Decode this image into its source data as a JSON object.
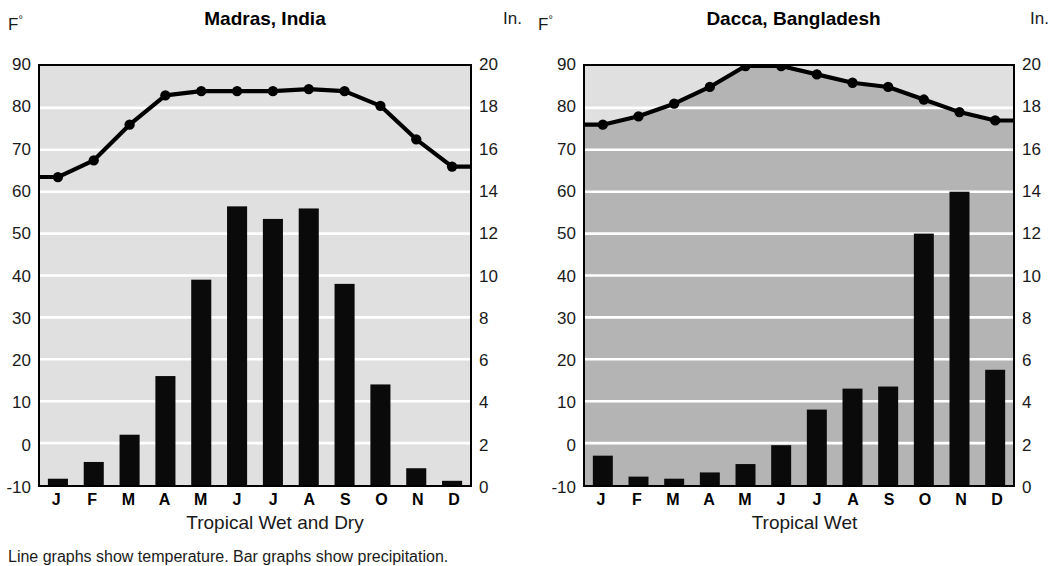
{
  "footnote": "Line graphs show temperature.  Bar graphs show precipitation.",
  "axis_labels": {
    "temperature_unit": "F",
    "degree_symbol": "°",
    "precip_unit": "In."
  },
  "months": [
    "J",
    "F",
    "M",
    "A",
    "M",
    "J",
    "J",
    "A",
    "S",
    "O",
    "N",
    "D"
  ],
  "colors": {
    "plot_background": "#e0e0e0",
    "plot_background_under_line": "#b4b4b4",
    "bar": "#0a0a0a",
    "line": "#000000",
    "gridline": "#ffffff",
    "border": "#000000"
  },
  "charts": [
    {
      "id": "madras",
      "title": "Madras, India",
      "climate_label": "Tropical Wet and Dry",
      "temp_ticks": [
        90,
        80,
        70,
        60,
        50,
        40,
        30,
        20,
        10,
        0,
        -10
      ],
      "precip_ticks": [
        20,
        18,
        16,
        14,
        12,
        10,
        8,
        6,
        4,
        2,
        0
      ],
      "temp_range": [
        -10,
        90
      ],
      "precip_range": [
        0,
        20
      ],
      "shade_under_line": false
    },
    {
      "id": "dacca",
      "title": "Dacca, Bangladesh",
      "climate_label": "Tropical Wet",
      "temp_ticks": [
        90,
        80,
        70,
        60,
        50,
        40,
        30,
        20,
        10,
        0,
        -10
      ],
      "precip_ticks": [
        20,
        18,
        16,
        14,
        12,
        10,
        8,
        6,
        4,
        2,
        0
      ],
      "temp_range": [
        -10,
        90
      ],
      "precip_range": [
        0,
        20
      ],
      "shade_under_line": true
    }
  ],
  "chart_data": [
    {
      "type": "line",
      "id": "madras",
      "title": "Madras, India",
      "subtitle": "Tropical Wet and Dry",
      "xlabel": "",
      "ylabel": "F°",
      "y2label": "In.",
      "categories": [
        "J",
        "F",
        "M",
        "A",
        "M",
        "J",
        "J",
        "A",
        "S",
        "O",
        "N",
        "D"
      ],
      "ylim": [
        -10,
        90
      ],
      "y2lim": [
        0,
        20
      ],
      "yticks": [
        -10,
        0,
        10,
        20,
        30,
        40,
        50,
        60,
        70,
        80,
        90
      ],
      "y2ticks": [
        0,
        2,
        4,
        6,
        8,
        10,
        12,
        14,
        16,
        18,
        20
      ],
      "grid": true,
      "legend": "none",
      "series": [
        {
          "name": "Temperature",
          "unit": "F°",
          "axis": "left",
          "plot": "line",
          "values": [
            63.5,
            67.5,
            76,
            83,
            84,
            84,
            84,
            84.5,
            84,
            80.5,
            72.5,
            66
          ]
        },
        {
          "name": "Precipitation",
          "unit": "In.",
          "axis": "right",
          "plot": "bar",
          "values": [
            0.3,
            1.1,
            2.4,
            5.2,
            9.8,
            13.3,
            12.7,
            13.2,
            9.6,
            4.8,
            0.8,
            0.2
          ]
        }
      ]
    },
    {
      "type": "line",
      "id": "dacca",
      "title": "Dacca, Bangladesh",
      "subtitle": "Tropical Wet",
      "xlabel": "",
      "ylabel": "F°",
      "y2label": "In.",
      "categories": [
        "J",
        "F",
        "M",
        "A",
        "M",
        "J",
        "J",
        "A",
        "S",
        "O",
        "N",
        "D"
      ],
      "ylim": [
        -10,
        90
      ],
      "y2lim": [
        0,
        20
      ],
      "yticks": [
        -10,
        0,
        10,
        20,
        30,
        40,
        50,
        60,
        70,
        80,
        90
      ],
      "y2ticks": [
        0,
        2,
        4,
        6,
        8,
        10,
        12,
        14,
        16,
        18,
        20
      ],
      "grid": true,
      "legend": "none",
      "series": [
        {
          "name": "Temperature",
          "unit": "F°",
          "axis": "left",
          "plot": "line",
          "values": [
            76,
            78,
            81,
            85,
            90,
            90,
            88,
            86,
            85,
            82,
            79,
            77
          ]
        },
        {
          "name": "Precipitation",
          "unit": "In.",
          "axis": "right",
          "plot": "bar",
          "values": [
            1.4,
            0.4,
            0.3,
            0.6,
            1.0,
            1.9,
            3.6,
            4.6,
            4.7,
            12.0,
            14.0,
            5.5
          ]
        }
      ]
    }
  ]
}
